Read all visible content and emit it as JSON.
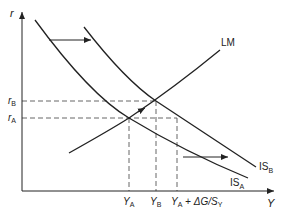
{
  "diagram": {
    "axes": {
      "y_label": "r",
      "x_label": "Y"
    },
    "curves": {
      "lm": {
        "label": "LM"
      },
      "is_a": {
        "label_main": "IS",
        "label_sub": "A"
      },
      "is_b": {
        "label_main": "IS",
        "label_sub": "B"
      }
    },
    "y_ticks": {
      "r_b": {
        "main": "r",
        "sub": "B"
      },
      "r_a": {
        "main": "r",
        "sub": "A"
      }
    },
    "x_ticks": {
      "y_a": {
        "main": "Y",
        "sub": "A"
      },
      "y_b": {
        "main": "Y",
        "sub": "B"
      },
      "y_a_plus": {
        "main": "Y",
        "sub": "A",
        "suffix": " + ΔG/S",
        "suffix_sub": "Y"
      }
    },
    "arrows": [
      {
        "name": "is-shift-arrow-upper",
        "meaning": "IS curve shifts right"
      },
      {
        "name": "is-shift-arrow-lower",
        "meaning": "IS curve shifts right"
      },
      {
        "name": "lm-movement-arrow",
        "meaning": "movement along LM from A to B"
      }
    ],
    "colors": {
      "line": "#222222",
      "dashed": "#555555",
      "background": "#ffffff"
    }
  }
}
